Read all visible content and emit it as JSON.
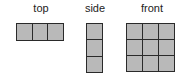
{
  "views": [
    {
      "id": "top",
      "label": "top",
      "rows": 1,
      "cols": 3
    },
    {
      "id": "side",
      "label": "side",
      "rows": 3,
      "cols": 1
    },
    {
      "id": "front",
      "label": "front",
      "rows": 3,
      "cols": 3
    }
  ],
  "colors": {
    "cell_fill": "#b9b9b9",
    "cell_border": "#2a2a2a"
  }
}
